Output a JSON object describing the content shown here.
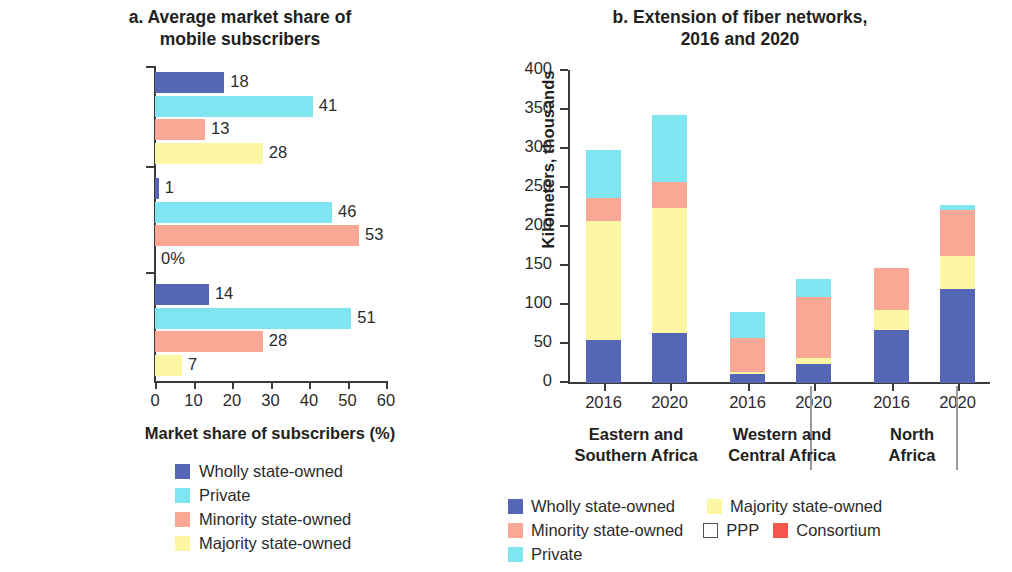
{
  "colors": {
    "wholly": "#5566b5",
    "private": "#7fe5f0",
    "minority": "#f8a894",
    "majority": "#fdf6a5",
    "ppp": "#ffffff",
    "consortium": "#f4564c",
    "axis": "#3a3a3a",
    "text": "#2b2b2b"
  },
  "panel_a": {
    "title": "a. Average market share of mobile subscribers",
    "title_line1": "a. Average market share of",
    "title_line2": "mobile subscribers",
    "xaxis_title": "Market share of subscribers (%)",
    "xticks": [
      "0",
      "10",
      "20",
      "30",
      "40",
      "50",
      "60"
    ],
    "legend": [
      {
        "label": "Wholly state-owned",
        "color": "#5566b5"
      },
      {
        "label": "Private",
        "color": "#7fe5f0"
      },
      {
        "label": "Minority state-owned",
        "color": "#f8a894"
      },
      {
        "label": "Majority state-owned",
        "color": "#fdf6a5"
      }
    ]
  },
  "panel_b": {
    "title": "b.  Extension of fiber networks, 2016 and 2020",
    "title_line1": "b.  Extension of fiber networks,",
    "title_line2": "2016 and 2020",
    "yaxis_title": "Kilometers, thousands",
    "yticks": [
      "0",
      "50",
      "100",
      "150",
      "200",
      "250",
      "300",
      "350",
      "400"
    ],
    "groups": [
      {
        "name_line1": "Eastern and",
        "name_line2": "Southern Africa",
        "years": [
          "2016",
          "2020"
        ]
      },
      {
        "name_line1": "Western and",
        "name_line2": "Central Africa",
        "years": [
          "2016",
          "2020"
        ]
      },
      {
        "name_line1": "North",
        "name_line2": "Africa",
        "years": [
          "2016",
          "2020"
        ]
      }
    ],
    "legend": [
      {
        "label": "Wholly state-owned",
        "color": "#5566b5"
      },
      {
        "label": "Majority state-owned",
        "color": "#fdf6a5"
      },
      {
        "label": "Minority state-owned",
        "color": "#f8a894"
      },
      {
        "label": "PPP",
        "color": "#ffffff"
      },
      {
        "label": "Consortium",
        "color": "#f4564c"
      },
      {
        "label": "Private",
        "color": "#7fe5f0"
      }
    ]
  },
  "chart_data": [
    {
      "type": "bar",
      "orientation": "horizontal",
      "panel": "a",
      "title": "a. Average market share of mobile subscribers",
      "xlabel": "Market share of subscribers (%)",
      "ylabel": "",
      "xlim": [
        0,
        60
      ],
      "xticks": [
        0,
        10,
        20,
        30,
        40,
        50,
        60
      ],
      "grid": false,
      "legend_position": "bottom",
      "categories": [
        "North Africa",
        "Western and Central Africa",
        "Eastern and Southern Africa"
      ],
      "series": [
        {
          "name": "Wholly state-owned",
          "color": "#5566b5",
          "values": [
            18,
            1,
            14
          ],
          "labels": [
            "18",
            "1",
            "14"
          ]
        },
        {
          "name": "Private",
          "color": "#7fe5f0",
          "values": [
            41,
            46,
            51
          ],
          "labels": [
            "41",
            "46",
            "51"
          ]
        },
        {
          "name": "Minority state-owned",
          "color": "#f8a894",
          "values": [
            13,
            53,
            28
          ],
          "labels": [
            "13",
            "53",
            "28"
          ]
        },
        {
          "name": "Majority state-owned",
          "color": "#fdf6a5",
          "values": [
            28,
            0,
            7
          ],
          "labels": [
            "28",
            "0%",
            "7"
          ]
        }
      ]
    },
    {
      "type": "bar",
      "stacked": true,
      "orientation": "vertical",
      "panel": "b",
      "title": "b. Extension of fiber networks, 2016 and 2020",
      "xlabel": "",
      "ylabel": "Kilometers, thousands",
      "ylim": [
        0,
        400
      ],
      "yticks": [
        0,
        50,
        100,
        150,
        200,
        250,
        300,
        350,
        400
      ],
      "grid": false,
      "legend_position": "bottom",
      "categories": [
        "Eastern and Southern Africa 2016",
        "Eastern and Southern Africa 2020",
        "Western and Central Africa 2016",
        "Western and Central Africa 2020",
        "North Africa 2016",
        "North Africa 2020"
      ],
      "series": [
        {
          "name": "Wholly state-owned",
          "color": "#5566b5",
          "values": [
            55,
            64,
            12,
            25,
            68,
            121
          ]
        },
        {
          "name": "Majority state-owned",
          "color": "#fdf6a5",
          "values": [
            153,
            161,
            2,
            7,
            25,
            42
          ]
        },
        {
          "name": "Minority state-owned",
          "color": "#f8a894",
          "values": [
            29,
            33,
            44,
            78,
            55,
            59
          ]
        },
        {
          "name": "PPP",
          "color": "#ffffff",
          "values": [
            0,
            0,
            0,
            0,
            0,
            0
          ]
        },
        {
          "name": "Consortium",
          "color": "#f4564c",
          "values": [
            0,
            0,
            0,
            0,
            0,
            0
          ]
        },
        {
          "name": "Private",
          "color": "#7fe5f0",
          "values": [
            62,
            85,
            33,
            23,
            0,
            6
          ]
        }
      ],
      "totals": [
        299,
        343,
        91,
        133,
        148,
        228
      ]
    }
  ]
}
